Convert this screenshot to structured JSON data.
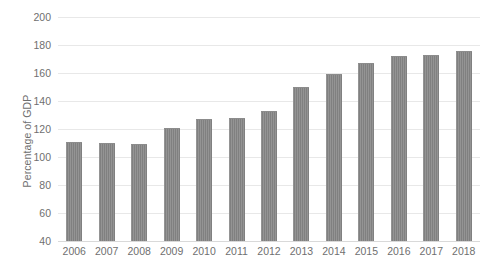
{
  "chart_data": {
    "type": "bar",
    "title": "",
    "subtitle": "",
    "xlabel": "",
    "ylabel": "Percentage of GDP",
    "categories": [
      "2006",
      "2007",
      "2008",
      "2009",
      "2010",
      "2011",
      "2012",
      "2013",
      "2014",
      "2015",
      "2016",
      "2017",
      "2018"
    ],
    "values": [
      111,
      110,
      109,
      121,
      127,
      128,
      133,
      150,
      159,
      167,
      172,
      173,
      176
    ],
    "ylim": [
      40,
      200
    ],
    "ytick_labels": [
      "200",
      "180",
      "160",
      "140",
      "120",
      "100",
      "80",
      "60",
      "40"
    ],
    "ytick_values": [
      200,
      180,
      160,
      140,
      120,
      100,
      80,
      60,
      40
    ],
    "grid": true,
    "grid_axis": "y",
    "legend": false,
    "legend_position": "none",
    "series": [
      {
        "name": "Percentage of GDP",
        "color": "#808080",
        "values": [
          111,
          110,
          109,
          121,
          127,
          128,
          133,
          150,
          159,
          167,
          172,
          173,
          176
        ]
      }
    ]
  },
  "colors": {
    "bar": "#808080",
    "gridline": "#e8e8e8",
    "axis": "#d9d9d9",
    "text": "#6f6f6f",
    "background": "#ffffff"
  }
}
